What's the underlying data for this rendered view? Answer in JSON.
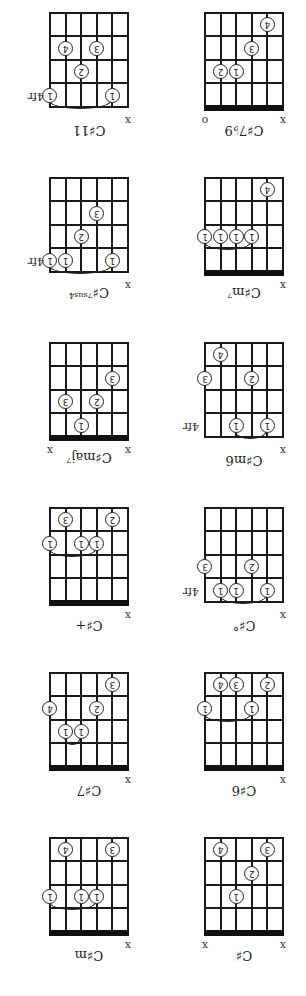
{
  "layout": {
    "grid_left_x": [
      23,
      178
    ],
    "nut_y_first_row": 64,
    "row_pitch": 165,
    "string_gap": 15.6,
    "fret_gap": 23.5
  },
  "chords": [
    {
      "name": "C♯",
      "sup": "",
      "row": 0,
      "col": 0,
      "start_fret": null,
      "fret_label": "",
      "markers": [
        {
          "string": 0,
          "type": "x"
        },
        {
          "string": 5,
          "type": "x"
        }
      ],
      "dots": [
        {
          "string": 1,
          "fret": 4,
          "finger": "3"
        },
        {
          "string": 2,
          "fret": 3,
          "finger": "2"
        },
        {
          "string": 3,
          "fret": 2,
          "finger": "1"
        },
        {
          "string": 4,
          "fret": 4,
          "finger": "4"
        }
      ],
      "barre": null
    },
    {
      "name": "C♯m",
      "sup": "",
      "row": 0,
      "col": 1,
      "start_fret": null,
      "fret_label": "",
      "markers": [
        {
          "string": 0,
          "type": "x"
        }
      ],
      "dots": [
        {
          "string": 1,
          "fret": 4,
          "finger": "3"
        },
        {
          "string": 2,
          "fret": 2,
          "finger": "1"
        },
        {
          "string": 3,
          "fret": 2,
          "finger": "1"
        },
        {
          "string": 4,
          "fret": 4,
          "finger": "4"
        },
        {
          "string": 5,
          "fret": 2,
          "finger": "1"
        }
      ],
      "barre": {
        "from": 2,
        "to": 5,
        "fret": 2
      }
    },
    {
      "name": "C♯6",
      "sup": "",
      "row": 1,
      "col": 0,
      "start_fret": null,
      "fret_label": "",
      "markers": [
        {
          "string": 0,
          "type": "x"
        }
      ],
      "dots": [
        {
          "string": 1,
          "fret": 4,
          "finger": "2"
        },
        {
          "string": 2,
          "fret": 3,
          "finger": "1"
        },
        {
          "string": 3,
          "fret": 4,
          "finger": "3"
        },
        {
          "string": 4,
          "fret": 4,
          "finger": "4"
        },
        {
          "string": 5,
          "fret": 3,
          "finger": "1"
        }
      ],
      "barre": {
        "from": 2,
        "to": 5,
        "fret": 3
      }
    },
    {
      "name": "C♯7",
      "sup": "",
      "row": 1,
      "col": 1,
      "start_fret": null,
      "fret_label": "",
      "markers": [
        {
          "string": 0,
          "type": "x"
        }
      ],
      "dots": [
        {
          "string": 1,
          "fret": 4,
          "finger": "3"
        },
        {
          "string": 2,
          "fret": 3,
          "finger": "2"
        },
        {
          "string": 3,
          "fret": 2,
          "finger": "1"
        },
        {
          "string": 4,
          "fret": 2,
          "finger": "1"
        },
        {
          "string": 5,
          "fret": 3,
          "finger": "4"
        }
      ],
      "barre": {
        "from": 3,
        "to": 4,
        "fret": 2
      }
    },
    {
      "name": "C♯°",
      "sup": "",
      "row": 2,
      "col": 0,
      "start_fret": 4,
      "fret_label": "4fr",
      "markers": [
        {
          "string": 0,
          "type": "x"
        }
      ],
      "dots": [
        {
          "string": 1,
          "fret": 1,
          "finger": "1"
        },
        {
          "string": 2,
          "fret": 2,
          "finger": "2"
        },
        {
          "string": 3,
          "fret": 1,
          "finger": "1"
        },
        {
          "string": 4,
          "fret": 1,
          "finger": "1"
        },
        {
          "string": 5,
          "fret": 2,
          "finger": "3"
        }
      ],
      "barre": {
        "from": 1,
        "to": 4,
        "fret": 1
      }
    },
    {
      "name": "C♯+",
      "sup": "",
      "row": 2,
      "col": 1,
      "start_fret": null,
      "fret_label": "",
      "markers": [
        {
          "string": 0,
          "type": "x"
        }
      ],
      "dots": [
        {
          "string": 1,
          "fret": 4,
          "finger": "2"
        },
        {
          "string": 2,
          "fret": 3,
          "finger": "1"
        },
        {
          "string": 3,
          "fret": 3,
          "finger": "1"
        },
        {
          "string": 4,
          "fret": 4,
          "finger": "3"
        },
        {
          "string": 5,
          "fret": 3,
          "finger": "1"
        }
      ],
      "barre": {
        "from": 2,
        "to": 5,
        "fret": 3
      }
    },
    {
      "name": "C♯m6",
      "sup": "",
      "row": 3,
      "col": 0,
      "start_fret": 4,
      "fret_label": "4fr",
      "markers": [
        {
          "string": 0,
          "type": "x"
        }
      ],
      "dots": [
        {
          "string": 1,
          "fret": 1,
          "finger": "1"
        },
        {
          "string": 2,
          "fret": 3,
          "finger": "2"
        },
        {
          "string": 3,
          "fret": 1,
          "finger": "1"
        },
        {
          "string": 4,
          "fret": 4,
          "finger": "4"
        },
        {
          "string": 5,
          "fret": 3,
          "finger": "3"
        }
      ],
      "barre": {
        "from": 1,
        "to": 3,
        "fret": 1
      }
    },
    {
      "name": "C♯maj",
      "sup": "7",
      "row": 3,
      "col": 1,
      "start_fret": null,
      "fret_label": "",
      "markers": [
        {
          "string": 0,
          "type": "x"
        },
        {
          "string": 5,
          "type": "x"
        }
      ],
      "dots": [
        {
          "string": 1,
          "fret": 3,
          "finger": "3"
        },
        {
          "string": 2,
          "fret": 2,
          "finger": "2"
        },
        {
          "string": 3,
          "fret": 1,
          "finger": "1"
        },
        {
          "string": 4,
          "fret": 2,
          "finger": "3"
        }
      ],
      "barre": null
    },
    {
      "name": "C♯m",
      "sup": "7",
      "row": 4,
      "col": 0,
      "start_fret": null,
      "fret_label": "",
      "markers": [
        {
          "string": 0,
          "type": "x"
        }
      ],
      "dots": [
        {
          "string": 1,
          "fret": 4,
          "finger": "4"
        },
        {
          "string": 2,
          "fret": 2,
          "finger": "1"
        },
        {
          "string": 3,
          "fret": 2,
          "finger": "1"
        },
        {
          "string": 4,
          "fret": 2,
          "finger": "1"
        },
        {
          "string": 5,
          "fret": 2,
          "finger": "1"
        }
      ],
      "barre": {
        "from": 2,
        "to": 5,
        "fret": 2
      }
    },
    {
      "name": "C♯",
      "sup": "7sus4",
      "row": 4,
      "col": 1,
      "start_fret": 4,
      "fret_label": "4fr",
      "markers": [
        {
          "string": 0,
          "type": "x"
        }
      ],
      "dots": [
        {
          "string": 1,
          "fret": 1,
          "finger": "1"
        },
        {
          "string": 2,
          "fret": 3,
          "finger": "3"
        },
        {
          "string": 3,
          "fret": 2,
          "finger": "2"
        },
        {
          "string": 4,
          "fret": 1,
          "finger": "1"
        },
        {
          "string": 5,
          "fret": 1,
          "finger": "1"
        }
      ],
      "barre": {
        "from": 1,
        "to": 5,
        "fret": 1
      }
    },
    {
      "name": "C♯7♭9",
      "sup": "",
      "row": 5,
      "col": 0,
      "start_fret": null,
      "fret_label": "",
      "markers": [
        {
          "string": 0,
          "type": "x"
        },
        {
          "string": 5,
          "type": "o"
        }
      ],
      "dots": [
        {
          "string": 1,
          "fret": 4,
          "finger": "4"
        },
        {
          "string": 2,
          "fret": 3,
          "finger": "3"
        },
        {
          "string": 3,
          "fret": 2,
          "finger": "1"
        },
        {
          "string": 4,
          "fret": 2,
          "finger": "2"
        }
      ],
      "barre": null
    },
    {
      "name": "C♯11",
      "sup": "",
      "row": 5,
      "col": 1,
      "start_fret": 4,
      "fret_label": "4fr",
      "markers": [
        {
          "string": 0,
          "type": "x"
        }
      ],
      "dots": [
        {
          "string": 1,
          "fret": 1,
          "finger": "1"
        },
        {
          "string": 2,
          "fret": 3,
          "finger": "3"
        },
        {
          "string": 3,
          "fret": 2,
          "finger": "2"
        },
        {
          "string": 4,
          "fret": 3,
          "finger": "4"
        },
        {
          "string": 5,
          "fret": 1,
          "finger": "1"
        }
      ],
      "barre": {
        "from": 1,
        "to": 5,
        "fret": 1
      }
    }
  ]
}
